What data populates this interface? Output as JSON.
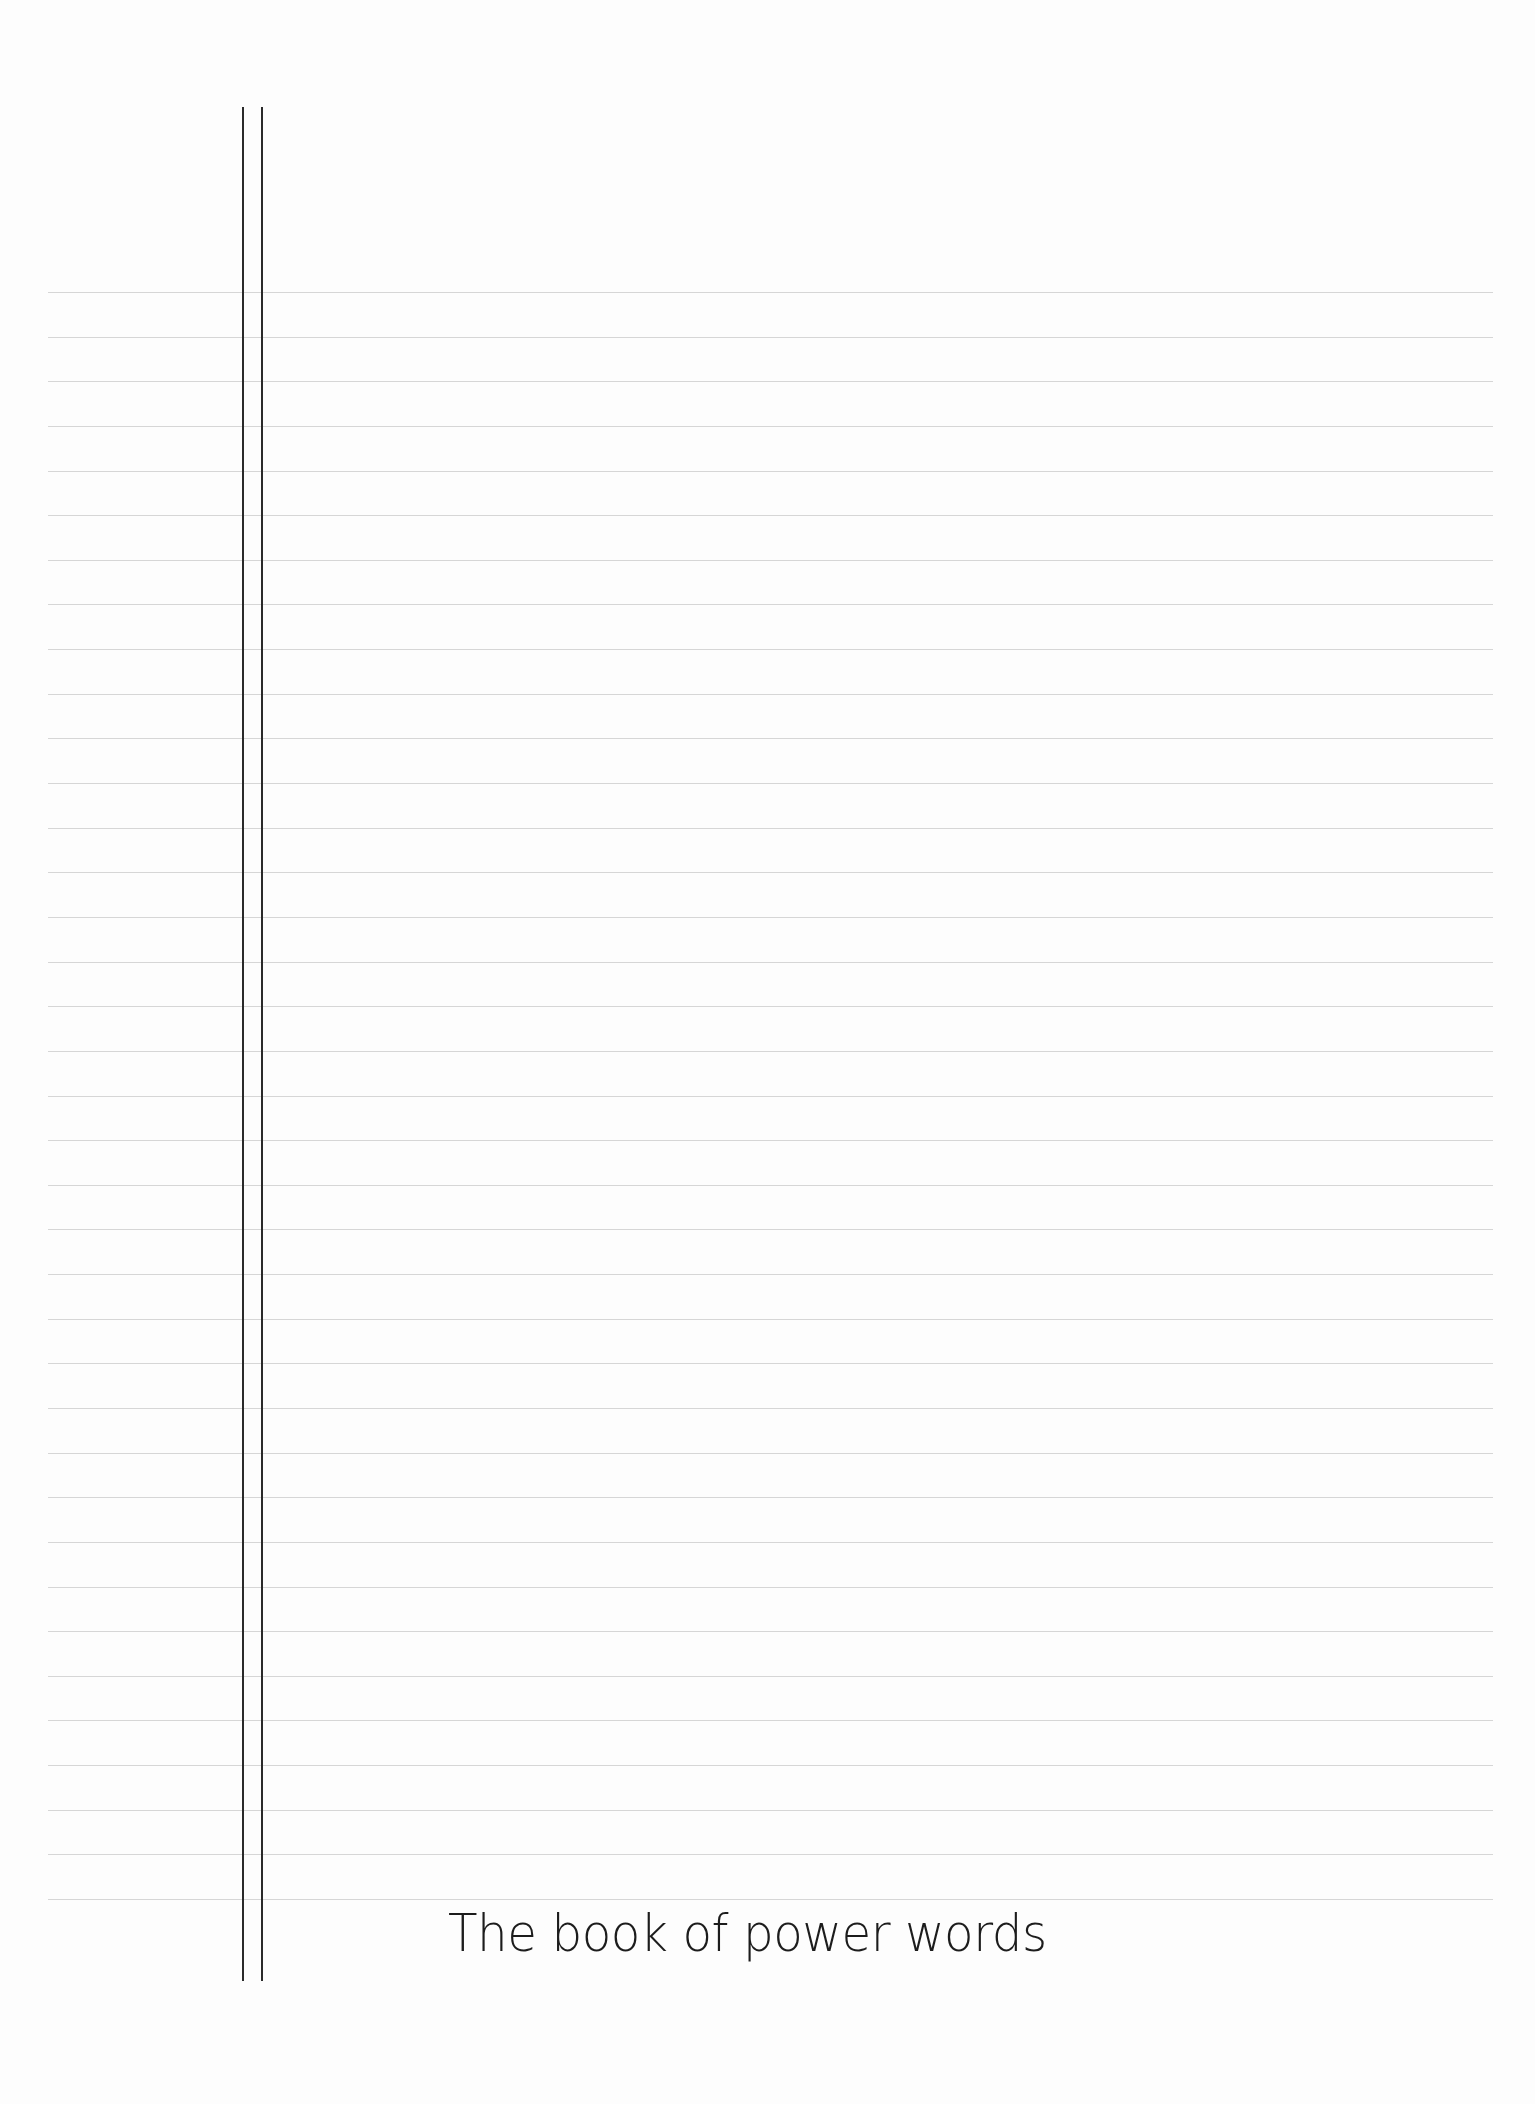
{
  "page": {
    "title": "The book of power words",
    "ruled_lines": {
      "count": 37,
      "first_y": 292,
      "spacing": 44.64,
      "color": "#d6d6d6"
    },
    "margin_lines": {
      "x_positions": [
        243,
        262
      ],
      "color": "#2a2a2a"
    }
  }
}
